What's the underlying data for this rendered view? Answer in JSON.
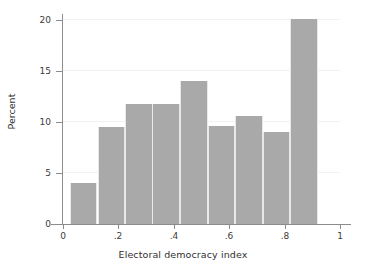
{
  "chart_data": {
    "type": "bar",
    "title": "",
    "subtitle": "",
    "xlabel": "Electoral democracy index",
    "ylabel": "Percent",
    "xlim": [
      0,
      1
    ],
    "ylim": [
      0,
      20.6
    ],
    "grid": true,
    "legend": null,
    "bar_color": "#a9a9a9",
    "bin_width": 0.0994,
    "bin_starts": [
      0.025,
      0.125,
      0.224,
      0.323,
      0.423,
      0.522,
      0.621,
      0.721,
      0.82
    ],
    "categories": [
      "0.03-0.12",
      "0.12-0.22",
      "0.22-0.32",
      "0.32-0.42",
      "0.42-0.52",
      "0.52-0.62",
      "0.62-0.72",
      "0.72-0.82",
      "0.82-0.92"
    ],
    "values": [
      4.0,
      9.5,
      11.8,
      11.8,
      14.0,
      9.6,
      10.6,
      9.0,
      20.1
    ],
    "x_ticks": [
      {
        "value": 0,
        "label": "0"
      },
      {
        "value": 0.2,
        "label": ".2"
      },
      {
        "value": 0.4,
        "label": ".4"
      },
      {
        "value": 0.6,
        "label": ".6"
      },
      {
        "value": 0.8,
        "label": ".8"
      },
      {
        "value": 1,
        "label": "1"
      }
    ],
    "y_ticks": [
      {
        "value": 0,
        "label": "0"
      },
      {
        "value": 5,
        "label": "5"
      },
      {
        "value": 10,
        "label": "10"
      },
      {
        "value": 15,
        "label": "15"
      },
      {
        "value": 20,
        "label": "20"
      }
    ]
  }
}
